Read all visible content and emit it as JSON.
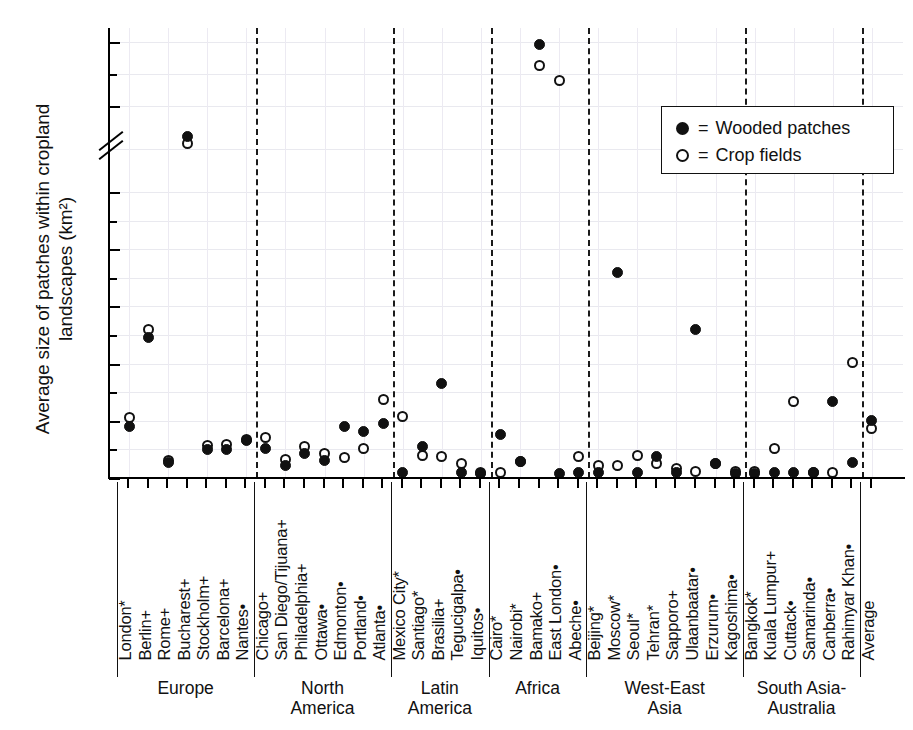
{
  "chart_data": {
    "type": "scatter",
    "title": "",
    "xlabel": "",
    "ylabel": "Average size of patches within cropland\nlandscapes (km²)",
    "ylim": [
      0,
      21
    ],
    "y_ticks_major": [
      0,
      1,
      2,
      3,
      4,
      5,
      10,
      20
    ],
    "y_ticks_minor": [
      0.5,
      1.5,
      2.5,
      3.5,
      4.5,
      15
    ],
    "axis_break": "between 5 and 10",
    "grid": true,
    "legend_position": "upper right",
    "series": [
      {
        "name": "Wooded patches",
        "marker": "filled-circle"
      },
      {
        "name": "Crop fields",
        "marker": "open-circle"
      }
    ],
    "categories": [
      "London*",
      "Berlin+",
      "Rome+",
      "Bucharest+",
      "Stockholm+",
      "Barcelona+",
      "Nantes•",
      "Chicago+",
      "San Diego/Tijuana+",
      "Philadelphia+",
      "Ottawa•",
      "Edmonton•",
      "Portland•",
      "Atlanta•",
      "Mexico City*",
      "Santiago*",
      "Brasilia+",
      "Tegucigalpa•",
      "Iquitos•",
      "Cairo*",
      "Nairobi*",
      "Bamako+",
      "East London•",
      "Abeche•",
      "Beijing*",
      "Moscow*",
      "Seoul*",
      "Tehran*",
      "Sapporo+",
      "Ulaanbaatar•",
      "Erzurum•",
      "Kagoshima•",
      "Bangkok*",
      "Kuala Lumpur+",
      "Cuttack•",
      "Samarinda•",
      "Canberra•",
      "Rahimyar Khan•",
      "Average"
    ],
    "wooded_patches": [
      0.9,
      2.45,
      0.27,
      8.2,
      0.5,
      0.5,
      0.65,
      0.52,
      0.22,
      0.43,
      0.3,
      0.9,
      0.82,
      0.95,
      0.1,
      0.55,
      1.65,
      0.1,
      0.08,
      0.76,
      0.28,
      19.6,
      0.08,
      0.1,
      0.1,
      3.6,
      0.1,
      0.38,
      0.1,
      2.6,
      0.25,
      0.08,
      0.08,
      0.1,
      0.1,
      0.1,
      1.33,
      0.27,
      1.0
    ],
    "crop_fields": [
      1.05,
      2.6,
      0.3,
      7.8,
      0.56,
      0.58,
      0.68,
      0.7,
      0.33,
      0.55,
      0.43,
      0.35,
      0.52,
      1.38,
      1.08,
      0.4,
      0.37,
      0.25,
      0.1,
      0.1,
      0.28,
      16.3,
      14.0,
      0.37,
      0.22,
      0.22,
      0.4,
      0.26,
      0.16,
      0.12,
      0.26,
      0.12,
      0.12,
      0.52,
      1.33,
      0.1,
      0.1,
      2.02,
      0.86
    ],
    "regions": [
      {
        "name": "Europe",
        "count": 7
      },
      {
        "name": "North\nAmerica",
        "count": 7
      },
      {
        "name": "Latin\nAmerica",
        "count": 5
      },
      {
        "name": "Africa",
        "count": 5
      },
      {
        "name": "West-East\nAsia",
        "count": 8
      },
      {
        "name": "South Asia-\nAustralia",
        "count": 6
      },
      {
        "name": "",
        "count": 1
      }
    ]
  },
  "legend": {
    "equals": "=",
    "wooded_label": "Wooded patches",
    "crop_label": "Crop fields"
  },
  "colors": {
    "marker": "#111111",
    "grid": "#e9e9ef",
    "axis": "#000000"
  }
}
